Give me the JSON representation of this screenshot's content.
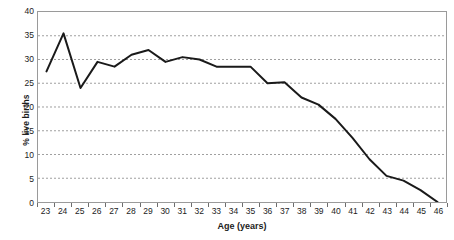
{
  "chart_data": {
    "type": "line",
    "title": "",
    "xlabel": "Age (years)",
    "ylabel": "% live births",
    "categories": [
      "23",
      "24",
      "25",
      "26",
      "27",
      "28",
      "29",
      "30",
      "31",
      "32",
      "33",
      "34",
      "35",
      "36",
      "37",
      "38",
      "39",
      "40",
      "41",
      "42",
      "43",
      "44",
      "45",
      "46"
    ],
    "values": [
      27.5,
      35.5,
      24.0,
      29.5,
      28.5,
      31.0,
      32.0,
      29.5,
      30.5,
      30.0,
      28.5,
      28.5,
      28.5,
      25.0,
      25.2,
      22.0,
      20.5,
      17.5,
      13.5,
      9.0,
      5.5,
      4.5,
      2.5,
      0.0
    ],
    "series": [
      {
        "name": "% live births",
        "values": [
          27.5,
          35.5,
          24.0,
          29.5,
          28.5,
          31.0,
          32.0,
          29.5,
          30.5,
          30.0,
          28.5,
          28.5,
          28.5,
          25.0,
          25.2,
          22.0,
          20.5,
          17.5,
          13.5,
          9.0,
          5.5,
          4.5,
          2.5,
          0.0
        ]
      }
    ],
    "ylim": [
      0,
      40
    ],
    "yticks": [
      0,
      5,
      10,
      15,
      20,
      25,
      30,
      35,
      40
    ],
    "ytick_labels": [
      "0",
      "5",
      "10",
      "15",
      "20",
      "25",
      "30",
      "35",
      "40"
    ],
    "grid": true,
    "grid_style": "dashed-horizontal",
    "legend": false,
    "line_color": "#1a1a1a",
    "line_width": 2.0,
    "grid_color": "#9f9f9f",
    "axis_color": "#9a9a9a",
    "background": "#ffffff"
  }
}
